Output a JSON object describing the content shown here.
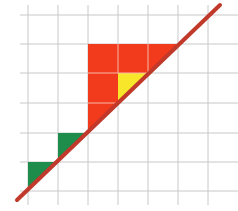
{
  "diagram": {
    "title": "Grid with diagonal line and shaded cells",
    "grid": {
      "x_lines": [
        28,
        58,
        88,
        118,
        148,
        178,
        208
      ],
      "y_lines": [
        15,
        44,
        73,
        103,
        133,
        162,
        191
      ],
      "x_extent": [
        20,
        238
      ],
      "y_extent": [
        5,
        205
      ],
      "color": "#c8c8c8"
    },
    "diagonal_line": {
      "x1": 17,
      "y1": 200,
      "x2": 220,
      "y2": 5,
      "color": "#c0392b",
      "width": 4
    },
    "colors": {
      "red": "#f23a1c",
      "green": "#1e8c4a",
      "yellow": "#f7e62a",
      "cell_divider": "#f6b9a8"
    },
    "shapes": [
      {
        "name": "red-region",
        "color": "red",
        "points": "88,44 178,44 148,73 118,103 88,133 88,44"
      },
      {
        "name": "yellow-triangle",
        "color": "yellow",
        "points": "118,73 148,73 118,103"
      },
      {
        "name": "green-triangle-upper",
        "color": "green",
        "points": "58,133 88,133 58,162"
      },
      {
        "name": "green-triangle-lower",
        "color": "green",
        "points": "28,162 58,162 28,191"
      }
    ]
  }
}
